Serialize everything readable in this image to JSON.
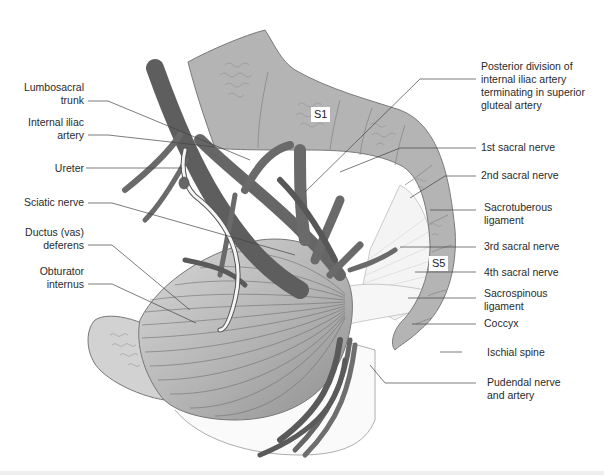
{
  "figure": {
    "colors": {
      "bone": "#b3b3b3",
      "bone_outline": "#7a7a7a",
      "vessel": "#6e6e6e",
      "vessel_dark": "#5a5a5a",
      "muscle_light": "#cfcfcf",
      "muscle_dark": "#9e9e9e",
      "ligament": "#f2f2f2",
      "leader_line": "#444444",
      "text": "#2a2a2a",
      "background": "#ffffff"
    }
  },
  "tags": {
    "s1": "S1",
    "s5": "S5"
  },
  "labels_left": [
    {
      "id": "lumbosacral-trunk",
      "lines": [
        "Lumbosacral",
        "trunk"
      ]
    },
    {
      "id": "internal-iliac-artery",
      "lines": [
        "Internal iliac",
        "artery"
      ]
    },
    {
      "id": "ureter",
      "lines": [
        "Ureter"
      ]
    },
    {
      "id": "sciatic-nerve",
      "lines": [
        "Sciatic nerve"
      ]
    },
    {
      "id": "ductus-deferens",
      "lines": [
        "Ductus (vas)",
        "deferens"
      ]
    },
    {
      "id": "obturator-internus",
      "lines": [
        "Obturator",
        "internus"
      ]
    }
  ],
  "labels_right": [
    {
      "id": "posterior-division",
      "lines": [
        "Posterior division of",
        "internal iliac artery",
        "terminating in superior",
        "gluteal artery"
      ]
    },
    {
      "id": "1st-sacral-nerve",
      "lines": [
        "1st sacral nerve"
      ]
    },
    {
      "id": "2nd-sacral-nerve",
      "lines": [
        "2nd sacral nerve"
      ]
    },
    {
      "id": "sacrotuberous-ligament",
      "lines": [
        "Sacrotuberous",
        "ligament"
      ]
    },
    {
      "id": "3rd-sacral-nerve",
      "lines": [
        "3rd sacral nerve"
      ]
    },
    {
      "id": "4th-sacral-nerve",
      "lines": [
        "4th sacral nerve"
      ]
    },
    {
      "id": "sacrospinous-ligament",
      "lines": [
        "Sacrospinous",
        "ligament"
      ]
    },
    {
      "id": "coccyx",
      "lines": [
        "Coccyx"
      ]
    },
    {
      "id": "ischial-spine",
      "lines": [
        "Ischial spine"
      ]
    },
    {
      "id": "pudendal-nerve-artery",
      "lines": [
        "Pudendal nerve",
        "and artery"
      ]
    }
  ]
}
